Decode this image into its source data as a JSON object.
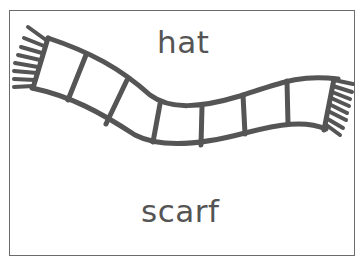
{
  "card": {
    "top_word": "hat",
    "bottom_word": "scarf",
    "illustration": "scarf-drawing"
  },
  "colors": {
    "ink": "#555555",
    "border": "#6b6b6b",
    "background": "#ffffff"
  }
}
